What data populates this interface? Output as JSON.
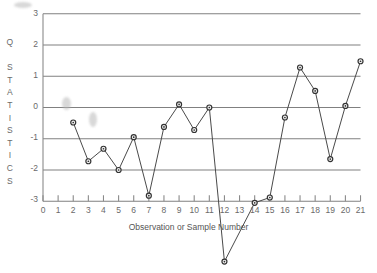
{
  "chart_data": {
    "type": "line",
    "title": "",
    "subtitle": "",
    "xlabel": "Observation or Sample Number",
    "ylabel": "Q STATISTICS",
    "ylabel_chars": [
      "Q",
      "",
      "S",
      "T",
      "A",
      "T",
      "I",
      "S",
      "T",
      "I",
      "C",
      "S"
    ],
    "x": [
      2,
      3,
      4,
      5,
      6,
      7,
      8,
      9,
      10,
      11,
      12,
      14,
      15,
      16,
      17,
      18,
      19,
      20,
      21
    ],
    "values": [
      -0.48,
      -1.72,
      -1.32,
      -2.0,
      -0.95,
      -2.82,
      -0.62,
      0.1,
      -0.72,
      0.0,
      -4.93,
      -3.05,
      -2.88,
      -0.32,
      1.28,
      0.53,
      -1.65,
      0.05,
      1.48
    ],
    "series": [
      {
        "name": "Q statistic",
        "x": [
          2,
          3,
          4,
          5,
          6,
          7,
          8,
          9,
          10,
          11,
          12,
          14,
          15,
          16,
          17,
          18,
          19,
          20,
          21
        ],
        "values": [
          -0.48,
          -1.72,
          -1.32,
          -2.0,
          -0.95,
          -2.82,
          -0.62,
          0.1,
          -0.72,
          0.0,
          -4.93,
          -3.05,
          -2.88,
          -0.32,
          1.28,
          0.53,
          -1.65,
          0.05,
          1.48
        ]
      }
    ],
    "xlim": [
      0,
      21
    ],
    "ylim": [
      -3,
      3
    ],
    "xticks": [
      0,
      1,
      2,
      3,
      4,
      5,
      6,
      7,
      8,
      9,
      10,
      11,
      12,
      13,
      14,
      15,
      16,
      17,
      18,
      19,
      20,
      21
    ],
    "xtick_labels": [
      "0",
      "1",
      "2",
      "3",
      "4",
      "5",
      "6",
      "7",
      "8",
      "9",
      "10",
      "11",
      "12",
      "13",
      "14",
      "15",
      "16",
      "17",
      "18",
      "19",
      "20",
      "21"
    ],
    "yticks": [
      -3,
      -2,
      -1,
      0,
      1,
      2,
      3
    ],
    "ytick_labels": [
      "-3",
      "-2",
      "-1",
      "0",
      "1",
      "2",
      "3"
    ],
    "grid": true,
    "grid_axis": "y",
    "legend": null,
    "legend_position": "none",
    "marker": "circle",
    "annotations": []
  },
  "style": {
    "background_color": "#ffffff",
    "grid_color": "#808080",
    "axis_color": "#8a8a8a",
    "line_color": "#4a4a4a",
    "marker_fill": "#f2f2f2",
    "marker_stroke": "#333333",
    "text_color": "#6a6a6a"
  },
  "artifacts": {
    "label": "scan-smudge",
    "items": [
      {
        "name": "smudge-upper",
        "x": 62,
        "y": 97,
        "w": 9,
        "h": 13
      },
      {
        "name": "smudge-lower",
        "x": 89,
        "y": 112,
        "w": 8,
        "h": 15
      },
      {
        "name": "smudge-corner",
        "x": 14,
        "y": 2,
        "w": 18,
        "h": 6
      }
    ]
  }
}
